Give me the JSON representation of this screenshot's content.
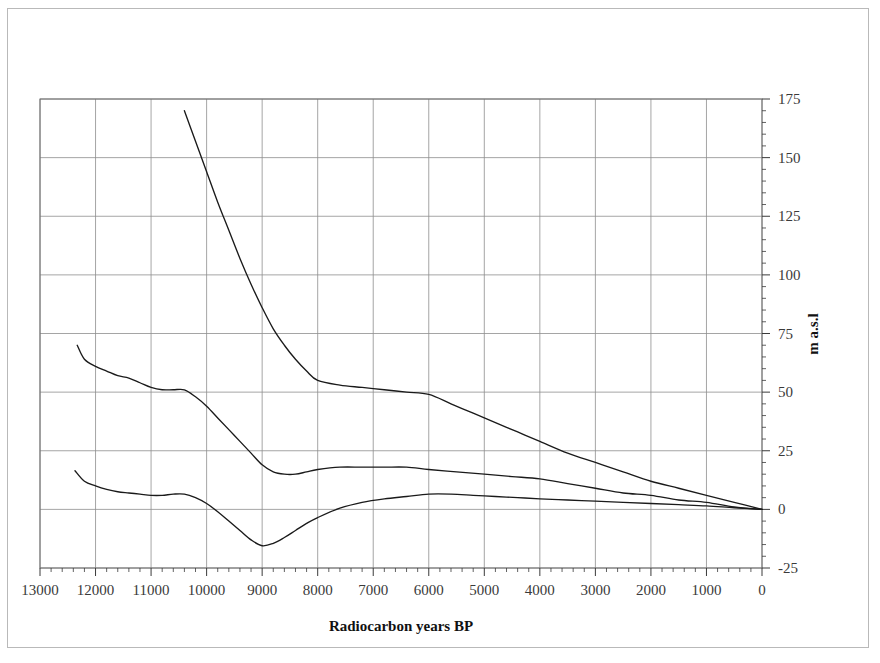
{
  "chart_data": {
    "type": "line",
    "title": "",
    "xlabel": "Radiocarbon years BP",
    "ylabel": "m a.s.l",
    "xlim": [
      13000,
      0
    ],
    "ylim": [
      -25,
      175
    ],
    "x_reversed": true,
    "grid": true,
    "legend": null,
    "x_ticks": [
      "13000",
      "12000",
      "11000",
      "10000",
      "9000",
      "8000",
      "7000",
      "6000",
      "5000",
      "4000",
      "3000",
      "2000",
      "1000",
      "0"
    ],
    "x_tick_values": [
      13000,
      12000,
      11000,
      10000,
      9000,
      8000,
      7000,
      6000,
      5000,
      4000,
      3000,
      2000,
      1000,
      0
    ],
    "y_ticks": [
      "175",
      "150",
      "125",
      "100",
      "75",
      "50",
      "25",
      "0",
      "-25"
    ],
    "y_tick_values": [
      175,
      150,
      125,
      100,
      75,
      50,
      25,
      0,
      -25
    ],
    "series": [
      {
        "name": "upper-curve",
        "color": "#1a1a1a",
        "x": [
          10400,
          10200,
          10000,
          9800,
          9600,
          9400,
          9200,
          9000,
          8800,
          8600,
          8400,
          8200,
          8000,
          7600,
          7200,
          6800,
          6400,
          6000,
          5600,
          5200,
          4800,
          4400,
          4000,
          3500,
          3000,
          2500,
          2000,
          1500,
          1000,
          500,
          0
        ],
        "y": [
          170,
          157,
          144,
          131,
          119,
          107,
          96,
          86,
          77,
          70,
          64,
          59,
          55,
          53,
          52,
          51,
          50,
          49,
          45,
          41,
          37,
          33,
          29,
          24,
          20,
          16,
          12,
          9,
          6,
          3,
          0
        ]
      },
      {
        "name": "middle-curve",
        "color": "#1a1a1a",
        "x": [
          12330,
          12200,
          12000,
          11800,
          11600,
          11400,
          11200,
          11000,
          10800,
          10600,
          10400,
          10200,
          10000,
          9800,
          9600,
          9400,
          9200,
          9000,
          8800,
          8600,
          8400,
          8200,
          8000,
          7600,
          7200,
          6800,
          6400,
          6000,
          5500,
          5000,
          4500,
          4000,
          3500,
          3000,
          2500,
          2000,
          1500,
          1000,
          500,
          0
        ],
        "y": [
          70,
          64,
          61,
          59,
          57,
          56,
          54,
          52,
          51,
          51,
          51,
          48,
          44,
          39,
          34,
          29,
          24,
          19,
          16,
          15,
          15,
          16,
          17,
          18,
          18,
          18,
          18,
          17,
          16,
          15,
          14,
          13,
          11,
          9,
          7,
          6,
          4,
          3,
          1,
          0
        ]
      },
      {
        "name": "lower-curve",
        "color": "#1a1a1a",
        "x": [
          12370,
          12200,
          12000,
          11800,
          11600,
          11400,
          11200,
          11000,
          10800,
          10600,
          10400,
          10200,
          10000,
          9800,
          9600,
          9400,
          9200,
          9000,
          8800,
          8600,
          8400,
          8200,
          8000,
          7600,
          7200,
          6800,
          6400,
          6000,
          5600,
          5200,
          4800,
          4400,
          4000,
          3500,
          3000,
          2500,
          2000,
          1500,
          1000,
          500,
          0
        ],
        "y": [
          16.5,
          12,
          10,
          8.5,
          7.5,
          7,
          6.5,
          6,
          6,
          6.5,
          6.5,
          5,
          2.5,
          -1,
          -5,
          -9,
          -13,
          -15.5,
          -14.5,
          -12,
          -9,
          -6,
          -3.5,
          0.5,
          3,
          4.5,
          5.5,
          6.5,
          6.5,
          6,
          5.5,
          5,
          4.5,
          4,
          3.5,
          3,
          2.5,
          2,
          1.5,
          0.7,
          0
        ]
      }
    ]
  },
  "axes": {
    "x_axis_title": "Radiocarbon years BP",
    "y_axis_title": "m a.s.l"
  }
}
